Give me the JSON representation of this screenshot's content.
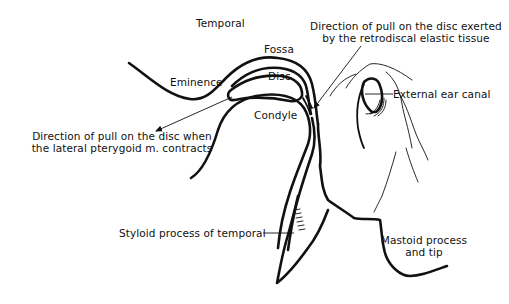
{
  "figure": {
    "type": "anatomical line drawing",
    "background": "#ffffff",
    "line_color": "#111111"
  },
  "labels": {
    "temporal": "Temporal",
    "fossa": "Fossa",
    "eminence": "Eminence",
    "disc": "Disc",
    "condyle": "Condyle",
    "external_ear_canal": "External ear canal",
    "retrodiscal_line1": "Direction of pull on the disc exerted",
    "retrodiscal_line2": "by the retrodiscal elastic tissue",
    "pterygoid_line1": "Direction of pull on the disc when",
    "pterygoid_line2": "the lateral pterygoid m. contracts",
    "styloid": "Styloid process of temporal",
    "mastoid_line1": "Mastoid process",
    "mastoid_line2": "and tip"
  },
  "arrows": [
    {
      "name": "lateral-pterygoid-pull",
      "from": [
        232,
        97
      ],
      "to": [
        155,
        132
      ],
      "direction": "anterior-inferior"
    },
    {
      "name": "retrodiscal-pull",
      "from": [
        360,
        46
      ],
      "to": [
        313,
        108
      ],
      "direction": "posterior-superior"
    }
  ]
}
